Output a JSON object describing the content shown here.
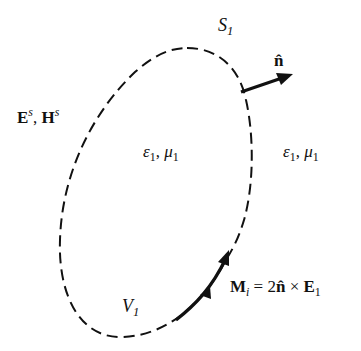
{
  "figure": {
    "boundary_label": {
      "symbol": "S",
      "sub": "1"
    },
    "normal_label": {
      "symbol": "n̂"
    },
    "scattered_fields_label": {
      "E": "E",
      "E_sup": "s",
      "sep": ", ",
      "H": "H",
      "H_sup": "s"
    },
    "inner_medium_label": {
      "eps": "ε",
      "eps_sub": "1",
      "sep": ", ",
      "mu": "μ",
      "mu_sub": "1"
    },
    "outer_medium_label": {
      "eps": "ε",
      "eps_sub": "1",
      "sep": ", ",
      "mu": "μ",
      "mu_sub": "1"
    },
    "volume_label": {
      "symbol": "V",
      "sub": "1"
    },
    "current_label": {
      "M": "M",
      "M_sub": "i",
      "eq": " = 2",
      "n": "n̂",
      "cross": " × ",
      "E": "E",
      "E_sub": "1"
    },
    "colors": {
      "stroke": "#111111",
      "background": "#ffffff"
    }
  }
}
